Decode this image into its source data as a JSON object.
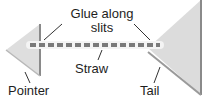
{
  "diagram": {
    "type": "labeled-illustration",
    "labels": {
      "glue_line1": "Glue along",
      "glue_line2": "slits",
      "straw": "Straw",
      "pointer": "Pointer",
      "tail": "Tail"
    },
    "parts": [
      {
        "name": "pointer",
        "shape": "small triangle pointing left",
        "position": "left end of straw"
      },
      {
        "name": "straw",
        "shape": "striped horizontal rod",
        "position": "center"
      },
      {
        "name": "tail",
        "shape": "large triangle pointing left",
        "position": "right end of straw"
      }
    ],
    "colors": {
      "fill": "#dcdcdc",
      "edge": "#8a8a8a",
      "straw_stripe": "#7a7a7a",
      "straw_base": "#f4f4f4",
      "leader": "#333333"
    }
  }
}
